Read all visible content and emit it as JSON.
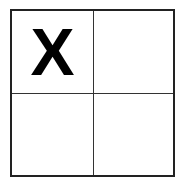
{
  "board": {
    "rows": 2,
    "cols": 2,
    "cells": [
      {
        "index": 0,
        "value": "X"
      },
      {
        "index": 1,
        "value": ""
      },
      {
        "index": 2,
        "value": ""
      },
      {
        "index": 3,
        "value": ""
      }
    ]
  },
  "colors": {
    "line": "#222222",
    "mark": "#000000",
    "background": "#ffffff"
  }
}
